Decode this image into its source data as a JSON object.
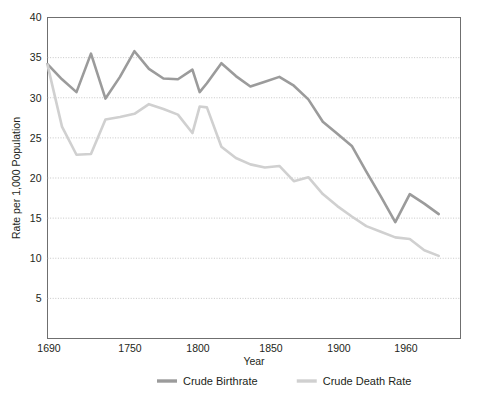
{
  "chart_data": {
    "type": "line",
    "title": "",
    "xlabel": "Year",
    "ylabel": "Rate per 1,000 Population",
    "ylim": [
      0,
      40
    ],
    "yticks": [
      5,
      10,
      15,
      20,
      25,
      30,
      35,
      40
    ],
    "xticks": [
      "1690",
      "1750",
      "1800",
      "1850",
      "1900",
      "1960"
    ],
    "xlim": [
      1690,
      1975
    ],
    "grid": "horizontal-dotted",
    "legend_position": "bottom-center",
    "series": [
      {
        "name": "Crude Birthrate",
        "color": "#9b9b9b",
        "x": [
          1690,
          1700,
          1710,
          1720,
          1730,
          1740,
          1750,
          1760,
          1770,
          1780,
          1790,
          1795,
          1800,
          1810,
          1820,
          1830,
          1840,
          1850,
          1860,
          1870,
          1880,
          1890,
          1900,
          1910,
          1920,
          1930,
          1940,
          1950,
          1960
        ],
        "values": [
          34.2,
          32.3,
          30.7,
          35.5,
          29.9,
          32.6,
          35.8,
          33.6,
          32.4,
          32.3,
          33.5,
          30.7,
          31.8,
          34.3,
          32.7,
          31.4,
          32.0,
          32.6,
          31.5,
          29.8,
          27.0,
          25.5,
          24.0,
          20.8,
          17.7,
          14.5,
          18.0,
          16.8,
          15.5
        ]
      },
      {
        "name": "Crude Death Rate",
        "color": "#d0d0d0",
        "x": [
          1690,
          1700,
          1710,
          1720,
          1730,
          1740,
          1750,
          1760,
          1770,
          1780,
          1790,
          1795,
          1800,
          1810,
          1820,
          1830,
          1840,
          1850,
          1860,
          1870,
          1880,
          1890,
          1900,
          1910,
          1920,
          1930,
          1940,
          1950,
          1960
        ],
        "values": [
          34.1,
          26.4,
          22.9,
          23.0,
          27.3,
          27.6,
          28.0,
          29.2,
          28.6,
          27.9,
          25.6,
          28.9,
          28.8,
          23.9,
          22.5,
          21.7,
          21.3,
          21.5,
          19.6,
          20.1,
          18.0,
          16.5,
          15.2,
          14.0,
          13.3,
          12.6,
          12.4,
          11.0,
          10.3
        ]
      }
    ]
  },
  "axes": {
    "y_title": "Rate per 1,000 Population",
    "x_title": "Year",
    "y_tick_labels": [
      "40",
      "35",
      "30",
      "25",
      "20",
      "15",
      "10",
      "5"
    ],
    "x_tick_labels": [
      "1690",
      "1750",
      "1800",
      "1850",
      "1900",
      "1960"
    ]
  },
  "legend": {
    "items": [
      {
        "label": "Crude Birthrate",
        "color": "#9b9b9b"
      },
      {
        "label": "Crude Death Rate",
        "color": "#d0d0d0"
      }
    ]
  },
  "colors": {
    "birthrate": "#9b9b9b",
    "death_rate": "#d0d0d0",
    "frame": "#6f6f6f",
    "gridline": "#b9b9b9",
    "text": "#231f20"
  }
}
